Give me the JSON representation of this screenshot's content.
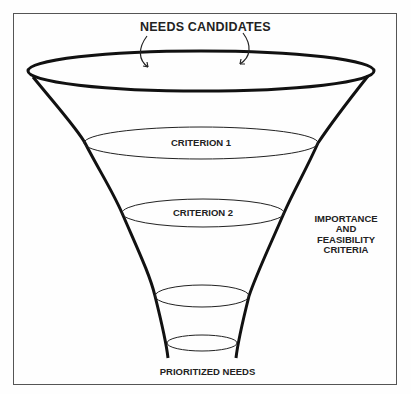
{
  "diagram": {
    "type": "funnel",
    "title": "NEEDS CANDIDATES",
    "stages": [
      {
        "label": "CRITERION 1"
      },
      {
        "label": "CRITERION 2"
      },
      {
        "label": ""
      },
      {
        "label": ""
      }
    ],
    "side_label": {
      "line1": "IMPORTANCE",
      "line2": "AND",
      "line3": "FEASIBILITY",
      "line4": "CRITERIA"
    },
    "output_label": "PRIORITIZED NEEDS",
    "colors": {
      "stroke": "#111111",
      "frame": "#555555",
      "background": "#fefefe"
    }
  }
}
